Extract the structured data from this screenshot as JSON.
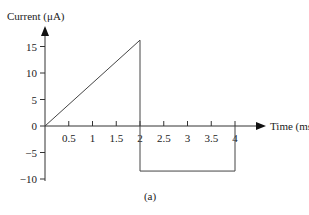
{
  "chart_data": {
    "type": "line",
    "title": "",
    "caption": "(a)",
    "xlabel": "Time (ms)",
    "ylabel": "Current (μA)",
    "xlim": [
      0,
      4.5
    ],
    "ylim": [
      -10,
      17
    ],
    "grid": false,
    "legend": null,
    "x_ticks": [
      0.5,
      1,
      1.5,
      2,
      2.5,
      3,
      3.5,
      4
    ],
    "x_tick_labels": [
      "0.5",
      "1",
      "1.5",
      "2",
      "2.5",
      "3",
      "3.5",
      "4"
    ],
    "y_ticks": [
      15,
      10,
      5,
      0,
      -5,
      -10
    ],
    "y_tick_labels": [
      "15",
      "10",
      "5",
      "0",
      "−5",
      "−10"
    ],
    "series": [
      {
        "name": "current",
        "x": [
          0,
          2,
          2,
          4,
          4
        ],
        "y": [
          0,
          16.2,
          -8.5,
          -8.5,
          0
        ]
      }
    ]
  }
}
